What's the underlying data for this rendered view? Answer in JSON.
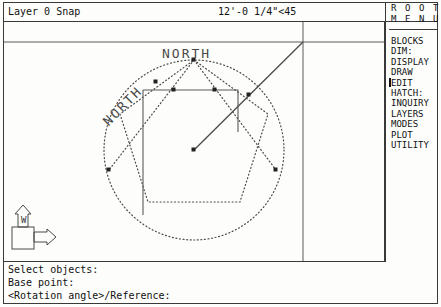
{
  "window": {
    "title": "AutoCAD Drawing Editor"
  },
  "status_bar": {
    "layer_text": "Layer 0 Snap",
    "coordinates": "12'-0 1/4\"<45"
  },
  "side_menu": {
    "title_lines": [
      "R O O T",
      "M E N U"
    ],
    "items": [
      {
        "label": "BLOCKS",
        "cursor": false
      },
      {
        "label": "DIM:",
        "cursor": false
      },
      {
        "label": "DISPLAY",
        "cursor": false
      },
      {
        "label": "DRAW",
        "cursor": false
      },
      {
        "label": "EDIT",
        "cursor": true
      },
      {
        "label": "HATCH:",
        "cursor": false
      },
      {
        "label": "INQUIRY",
        "cursor": false
      },
      {
        "label": "LAYERS",
        "cursor": false
      },
      {
        "label": "MODES",
        "cursor": false
      },
      {
        "label": "PLOT",
        "cursor": false
      },
      {
        "label": "UTILITY",
        "cursor": false
      }
    ]
  },
  "command_lines": [
    "Select objects:",
    "Base point:",
    "<Rotation angle>/Reference:"
  ],
  "drawing": {
    "labels": [
      {
        "text": "NORTH",
        "x": 96,
        "y": 96,
        "rotation": -45
      },
      {
        "text": "NORTH",
        "x": 158,
        "y": 30,
        "rotation": 0
      }
    ],
    "ucs_icon": {
      "x_label": "X",
      "y_label": "Y",
      "world_label": "W"
    },
    "colors": {
      "line": "#4a4a4a",
      "solid": "#5a5a5a",
      "background": "#fdfdfb"
    }
  }
}
